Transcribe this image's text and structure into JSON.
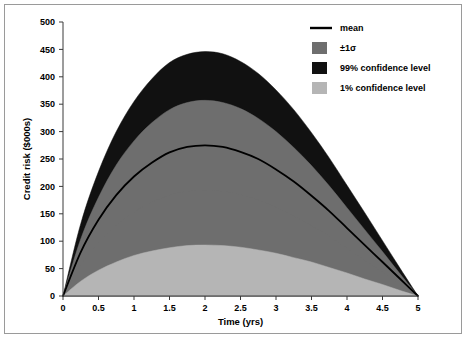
{
  "chart_data": {
    "type": "area",
    "title": "",
    "xlabel": "Time (yrs)",
    "ylabel": "Credit risk ($000s)",
    "xlim": [
      0,
      5
    ],
    "ylim": [
      0,
      500
    ],
    "xticks": [
      "0",
      "0.5",
      "1",
      "1.5",
      "2",
      "2.5",
      "3",
      "3.5",
      "4",
      "4.5",
      "5"
    ],
    "xtick_values": [
      0,
      0.5,
      1,
      1.5,
      2,
      2.5,
      3,
      3.5,
      4,
      4.5,
      5
    ],
    "yticks": [
      "0",
      "50",
      "100",
      "150",
      "200",
      "250",
      "300",
      "350",
      "400",
      "450",
      "500"
    ],
    "ytick_values": [
      0,
      50,
      100,
      150,
      200,
      250,
      300,
      350,
      400,
      450,
      500
    ],
    "grid": false,
    "legend_position": "top-right",
    "x": [
      0,
      0.25,
      0.5,
      0.75,
      1,
      1.25,
      1.5,
      1.75,
      2,
      2.25,
      2.5,
      2.75,
      3,
      3.25,
      3.5,
      3.75,
      4,
      4.25,
      4.5,
      4.75,
      5
    ],
    "series": [
      {
        "name": "99% confidence level",
        "role": "upper_99",
        "color": "#111111",
        "values": [
          0,
          132,
          227,
          300,
          355,
          396,
          426,
          441,
          446,
          442,
          428,
          406,
          376,
          340,
          298,
          252,
          202,
          152,
          101,
          50,
          0
        ]
      },
      {
        "name": "+1 sigma",
        "role": "upper_1sigma",
        "color": "#6e6e6e",
        "values": [
          0,
          104,
          180,
          239,
          283,
          316,
          340,
          353,
          357,
          353,
          342,
          324,
          300,
          271,
          238,
          201,
          161,
          121,
          81,
          40,
          0
        ]
      },
      {
        "name": "mean",
        "role": "mean",
        "color": "#000000",
        "values": [
          0,
          80,
          139,
          184,
          218,
          243,
          262,
          272,
          275,
          272,
          263,
          250,
          231,
          209,
          183,
          155,
          124,
          93,
          62,
          31,
          0
        ]
      },
      {
        "name": "-1 sigma",
        "role": "lower_1sigma",
        "color": "#6e6e6e",
        "values": [
          0,
          56,
          97,
          129,
          153,
          171,
          184,
          191,
          193,
          191,
          185,
          175,
          162,
          146,
          128,
          109,
          87,
          65,
          44,
          22,
          0
        ]
      },
      {
        "name": "1% confidence level",
        "role": "lower_1",
        "color": "#b5b5b5",
        "values": [
          0,
          27,
          47,
          62,
          74,
          82,
          88,
          92,
          93,
          92,
          89,
          84,
          78,
          70,
          62,
          52,
          42,
          31,
          21,
          10,
          0
        ]
      }
    ],
    "legend": [
      {
        "label": "mean",
        "type": "line",
        "color": "#000000"
      },
      {
        "label": "±1σ",
        "type": "swatch",
        "color": "#6e6e6e"
      },
      {
        "label": "99% confidence level",
        "type": "swatch",
        "color": "#111111"
      },
      {
        "label": "1% confidence level",
        "type": "swatch",
        "color": "#b5b5b5"
      }
    ],
    "colors": {
      "band_99": "#111111",
      "band_1sigma": "#6e6e6e",
      "band_1pct": "#b5b5b5",
      "mean_line": "#000000",
      "axis": "#3a3a3a",
      "background": "#ffffff",
      "frame": "#9a9a9a"
    }
  }
}
